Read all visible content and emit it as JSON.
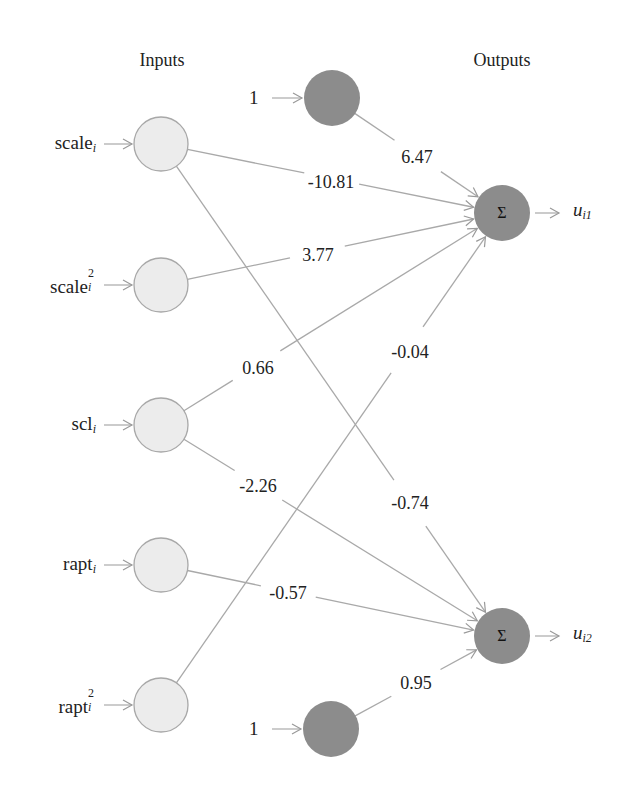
{
  "headers": {
    "inputs": "Inputs",
    "outputs": "Outputs"
  },
  "inputs": [
    {
      "id": "scale",
      "base": "scale",
      "sub": "i",
      "sup": "",
      "cx": 161,
      "cy": 144
    },
    {
      "id": "scale2",
      "base": "scale",
      "sub": "i",
      "sup": "2",
      "cx": 161,
      "cy": 285
    },
    {
      "id": "scl",
      "base": "scl",
      "sub": "i",
      "sup": "",
      "cx": 161,
      "cy": 425
    },
    {
      "id": "rapt",
      "base": "rapt",
      "sub": "i",
      "sup": "",
      "cx": 161,
      "cy": 565
    },
    {
      "id": "rapt2",
      "base": "rapt",
      "sub": "i",
      "sup": "2",
      "cx": 161,
      "cy": 705
    }
  ],
  "bias": [
    {
      "id": "bias1",
      "label": "1",
      "cx": 332,
      "cy": 98
    },
    {
      "id": "bias2",
      "label": "1",
      "cx": 331,
      "cy": 729
    }
  ],
  "outputs": [
    {
      "id": "u1",
      "symbol": "Σ",
      "out_base": "u",
      "out_sub": "i1",
      "cx": 502,
      "cy": 213
    },
    {
      "id": "u2",
      "symbol": "Σ",
      "out_base": "u",
      "out_sub": "i2",
      "cx": 502,
      "cy": 636
    }
  ],
  "weights": [
    {
      "from": "bias1",
      "to": "u1",
      "value": "6.47",
      "lx": 417,
      "ly": 157
    },
    {
      "from": "scale",
      "to": "u1",
      "value": "-10.81",
      "lx": 331,
      "ly": 182
    },
    {
      "from": "scale2",
      "to": "u1",
      "value": "3.77",
      "lx": 318,
      "ly": 255
    },
    {
      "from": "scl",
      "to": "u1",
      "value": "0.66",
      "lx": 258,
      "ly": 368
    },
    {
      "from": "rapt2",
      "to": "u1",
      "value": "-0.04",
      "lx": 410,
      "ly": 352
    },
    {
      "from": "scale",
      "to": "u2",
      "value": "-0.74",
      "lx": 410,
      "ly": 503
    },
    {
      "from": "scl",
      "to": "u2",
      "value": "-2.26",
      "lx": 258,
      "ly": 486
    },
    {
      "from": "rapt",
      "to": "u2",
      "value": "-0.57",
      "lx": 288,
      "ly": 593
    },
    {
      "from": "bias2",
      "to": "u2",
      "value": "0.95",
      "lx": 416,
      "ly": 683
    }
  ],
  "colors": {
    "input_fill": "#ececec",
    "input_stroke": "#a8a8a8",
    "dark_fill": "#8c8c8c",
    "line": "#a9a9a9"
  }
}
